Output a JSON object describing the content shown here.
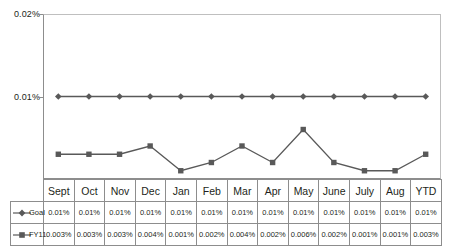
{
  "chart_data": {
    "type": "line",
    "title": "",
    "xlabel": "",
    "ylabel": "",
    "ylim": [
      0,
      0.02
    ],
    "ytick_labels": [
      "0.02%",
      "0.01%"
    ],
    "ytick_values": [
      0.02,
      0.01
    ],
    "grid": false,
    "legend_position": "data-table",
    "categories": [
      "Sept",
      "Oct",
      "Nov",
      "Dec",
      "Jan",
      "Feb",
      "Mar",
      "Apr",
      "May",
      "June",
      "July",
      "Aug",
      "YTD"
    ],
    "series": [
      {
        "name": "Goal",
        "marker": "diamond",
        "color": "#595959",
        "values": [
          0.01,
          0.01,
          0.01,
          0.01,
          0.01,
          0.01,
          0.01,
          0.01,
          0.01,
          0.01,
          0.01,
          0.01,
          0.01
        ],
        "labels": [
          "0.01%",
          "0.01%",
          "0.01%",
          "0.01%",
          "0.01%",
          "0.01%",
          "0.01%",
          "0.01%",
          "0.01%",
          "0.01%",
          "0.01%",
          "0.01%",
          "0.01%"
        ]
      },
      {
        "name": "FY11",
        "marker": "square",
        "color": "#595959",
        "values": [
          0.003,
          0.003,
          0.003,
          0.004,
          0.001,
          0.002,
          0.004,
          0.002,
          0.006,
          0.002,
          0.001,
          0.001,
          0.003
        ],
        "labels": [
          "0.003%",
          "0.003%",
          "0.003%",
          "0.004%",
          "0.001%",
          "0.002%",
          "0.004%",
          "0.002%",
          "0.006%",
          "0.002%",
          "0.001%",
          "0.001%",
          "0.003%"
        ]
      }
    ]
  },
  "colors": {
    "series": "#595959",
    "axis": "#8d8d8d",
    "plot_border_light": "#bfbfbf",
    "text": "#231f20"
  }
}
